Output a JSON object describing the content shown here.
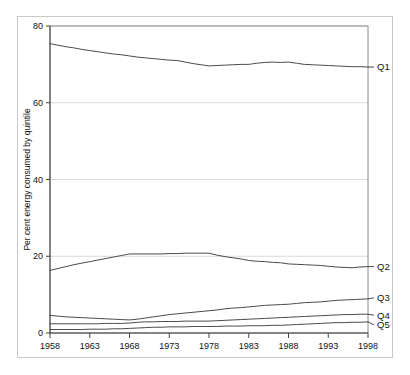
{
  "chart_data": {
    "type": "line",
    "title": "",
    "xlabel": "",
    "ylabel": "Per cent energy consumed by quintile",
    "xlim": [
      1958,
      1998
    ],
    "ylim": [
      0,
      80
    ],
    "grid": true,
    "legend_position": "right-inline",
    "x": [
      1958,
      1959,
      1960,
      1961,
      1962,
      1963,
      1964,
      1965,
      1966,
      1967,
      1968,
      1969,
      1970,
      1971,
      1972,
      1973,
      1974,
      1975,
      1976,
      1977,
      1978,
      1979,
      1980,
      1981,
      1982,
      1983,
      1984,
      1985,
      1986,
      1987,
      1988,
      1989,
      1990,
      1991,
      1992,
      1993,
      1994,
      1995,
      1996,
      1997,
      1998
    ],
    "xticks": [
      1958,
      1963,
      1968,
      1973,
      1978,
      1983,
      1988,
      1993,
      1998
    ],
    "xtick_labels": [
      "1958",
      "1963",
      "1968",
      "1973",
      "1978",
      "1983",
      "1988",
      "1993",
      "1998"
    ],
    "yticks": [
      0,
      20,
      40,
      60,
      80
    ],
    "ytick_labels": [
      "0",
      "20",
      "40",
      "60",
      "80"
    ],
    "series": [
      {
        "name": "Q1",
        "label": "Q1",
        "color": "#4a4a4a",
        "values": [
          75.4,
          75.0,
          74.6,
          74.3,
          73.9,
          73.6,
          73.3,
          73.0,
          72.7,
          72.5,
          72.2,
          71.9,
          71.7,
          71.5,
          71.3,
          71.1,
          71.0,
          70.6,
          70.2,
          69.9,
          69.6,
          69.7,
          69.8,
          69.9,
          70.0,
          70.0,
          70.3,
          70.5,
          70.6,
          70.5,
          70.6,
          70.3,
          70.0,
          69.9,
          69.8,
          69.7,
          69.6,
          69.5,
          69.4,
          69.4,
          69.3
        ]
      },
      {
        "name": "Q2",
        "label": "Q2",
        "color": "#4a4a4a",
        "values": [
          16.3,
          16.8,
          17.3,
          17.8,
          18.2,
          18.6,
          19.0,
          19.4,
          19.8,
          20.2,
          20.6,
          20.6,
          20.6,
          20.6,
          20.6,
          20.7,
          20.7,
          20.8,
          20.8,
          20.8,
          20.8,
          20.3,
          19.9,
          19.6,
          19.3,
          18.9,
          18.7,
          18.6,
          18.4,
          18.3,
          18.0,
          17.9,
          17.8,
          17.7,
          17.6,
          17.4,
          17.2,
          17.1,
          17.0,
          17.2,
          17.3
        ]
      },
      {
        "name": "Q3",
        "label": "Q3",
        "color": "#4a4a4a",
        "values": [
          4.6,
          4.4,
          4.2,
          4.1,
          4.0,
          3.9,
          3.8,
          3.7,
          3.6,
          3.5,
          3.4,
          3.6,
          3.9,
          4.2,
          4.5,
          4.8,
          5.0,
          5.2,
          5.4,
          5.6,
          5.8,
          6.0,
          6.3,
          6.5,
          6.6,
          6.8,
          7.0,
          7.2,
          7.3,
          7.4,
          7.5,
          7.7,
          7.9,
          8.0,
          8.1,
          8.3,
          8.5,
          8.6,
          8.7,
          8.8,
          8.9
        ]
      },
      {
        "name": "Q4",
        "label": "Q4",
        "color": "#4a4a4a",
        "values": [
          2.4,
          2.4,
          2.4,
          2.4,
          2.4,
          2.4,
          2.4,
          2.5,
          2.5,
          2.5,
          2.6,
          2.8,
          2.9,
          2.9,
          3.0,
          3.0,
          3.0,
          3.1,
          3.1,
          3.1,
          3.1,
          3.2,
          3.3,
          3.4,
          3.5,
          3.6,
          3.7,
          3.8,
          3.9,
          4.0,
          4.1,
          4.2,
          4.3,
          4.4,
          4.5,
          4.6,
          4.7,
          4.8,
          4.8,
          4.9,
          4.9
        ]
      },
      {
        "name": "Q5",
        "label": "Q5",
        "color": "#4a4a4a",
        "values": [
          0.9,
          0.9,
          0.9,
          0.9,
          0.9,
          1.0,
          1.0,
          1.0,
          1.1,
          1.1,
          1.2,
          1.3,
          1.4,
          1.5,
          1.5,
          1.6,
          1.6,
          1.6,
          1.7,
          1.7,
          1.7,
          1.7,
          1.8,
          1.8,
          1.8,
          1.9,
          1.9,
          1.9,
          2.0,
          2.0,
          2.1,
          2.2,
          2.3,
          2.4,
          2.5,
          2.6,
          2.7,
          2.7,
          2.8,
          2.8,
          2.9
        ]
      }
    ]
  }
}
